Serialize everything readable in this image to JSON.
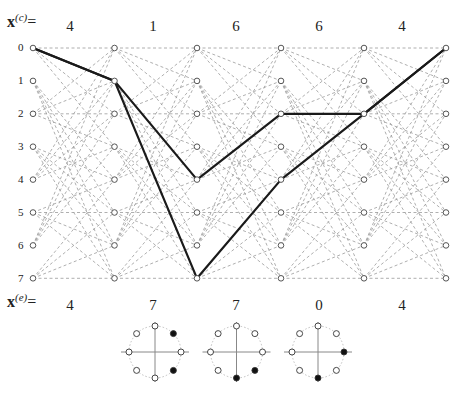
{
  "diagram": {
    "type": "trellis",
    "states": 8,
    "columns": 6,
    "row_labels": [
      "0",
      "1",
      "2",
      "3",
      "4",
      "5",
      "6",
      "7"
    ],
    "transition_rule": "even states -> {0,1,2,3}; odd states -> {4,5,6,7}",
    "colors": {
      "dashed_edge": "#9a9a9a",
      "bold_path": "#1a1a1a",
      "node_fill": "#ffffff",
      "node_stroke": "#444444"
    }
  },
  "top_sequence": {
    "label_main": "x",
    "label_sup": "(c)",
    "label_eq": "=",
    "symbols": [
      "4",
      "1",
      "6",
      "6",
      "4"
    ]
  },
  "bottom_sequence": {
    "label_main": "x",
    "label_sup": "(e)",
    "label_eq": "=",
    "symbols": [
      "4",
      "7",
      "7",
      "0",
      "4"
    ]
  },
  "bold_paths": [
    {
      "name": "correct-path",
      "states": [
        0,
        1,
        4,
        2,
        2,
        0
      ]
    },
    {
      "name": "error-path",
      "states": [
        0,
        1,
        7,
        4,
        2,
        0
      ]
    }
  ],
  "constellations": [
    {
      "name": "constellation-1",
      "filled_points": [
        1,
        7
      ]
    },
    {
      "name": "constellation-2",
      "filled_points": [
        6,
        7
      ]
    },
    {
      "name": "constellation-3",
      "filled_points": [
        0,
        6
      ]
    }
  ]
}
